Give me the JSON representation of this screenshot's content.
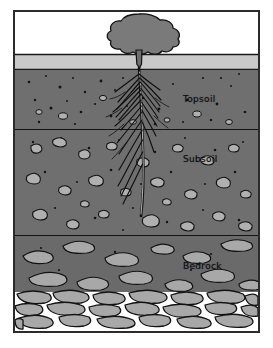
{
  "diagram": {
    "type": "cross-section",
    "background": "#ffffff",
    "frame": {
      "border_color": "#2b2b2b",
      "x": 13,
      "y": 10,
      "width": 247,
      "height": 323
    },
    "labels": [
      {
        "id": "topsoil",
        "text": "Topsoil",
        "color": "#0d0d0d",
        "x": 168,
        "y": 82
      },
      {
        "id": "subsoil",
        "text": "Subsoil",
        "color": "#0d0d0d",
        "x": 168,
        "y": 142
      },
      {
        "id": "bedrock",
        "text": "Bedrock",
        "color": "#0d0d0d",
        "x": 168,
        "y": 249
      }
    ],
    "layers": [
      {
        "name": "sky",
        "color": "#ffffff",
        "top": 0,
        "bottom": 52
      },
      {
        "name": "surface-litter",
        "color": "#c9c9c9",
        "top": 52,
        "bottom": 68
      },
      {
        "name": "topsoil",
        "color": "#6f6f6f",
        "top": 68,
        "bottom": 128
      },
      {
        "name": "subsoil",
        "color": "#6f6f6f",
        "top": 128,
        "bottom": 234
      },
      {
        "name": "bedrock",
        "color": "#6a6a6a",
        "top": 234,
        "bottom": 290
      },
      {
        "name": "solid-bedrock",
        "color": "#ffffff",
        "top": 290,
        "bottom": 323
      }
    ],
    "colors": {
      "soil": "#6f6f6f",
      "litter": "#c9c9c9",
      "pebble": "#b0b0b0",
      "stone": "#a8a8a8",
      "outline": "#121212",
      "tree": "#7a7a7a",
      "root": "#101010",
      "frame": "#2b2b2b"
    },
    "tree": {
      "name": "tree",
      "canopy_color": "#7a7a7a",
      "trunk_color": "#6e6e6e",
      "center_x": 124,
      "canopy_top": 8,
      "canopy_bottom": 44,
      "trunk_bottom": 62
    },
    "root": {
      "name": "taproot",
      "color": "#101010",
      "top_x": 124,
      "top_y": 66,
      "tip_y": 212,
      "lateral_count": 22
    }
  }
}
